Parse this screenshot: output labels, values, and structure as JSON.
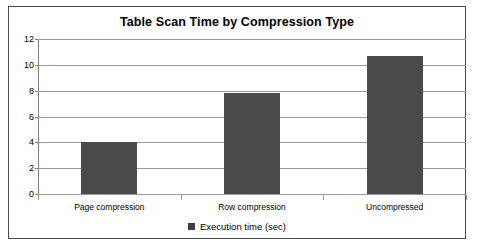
{
  "chart_data": {
    "type": "bar",
    "title": "Table Scan Time by Compression Type",
    "categories": [
      "Page compression",
      "Row compression",
      "Uncompressed"
    ],
    "values": [
      4.0,
      7.85,
      10.7
    ],
    "series": [
      {
        "name": "Execution time (sec)",
        "values": [
          4.0,
          7.85,
          10.7
        ]
      }
    ],
    "xlabel": "",
    "ylabel": "",
    "ylim": [
      0,
      12
    ],
    "ytick_labels": [
      "0",
      "2",
      "4",
      "6",
      "8",
      "10",
      "12"
    ],
    "ytick_values": [
      0,
      2,
      4,
      6,
      8,
      10,
      12
    ],
    "grid": true,
    "legend_position": "bottom",
    "legend_entries": [
      "Execution time (sec)"
    ],
    "bar_color": "#4a4a4a",
    "gridline_color": "#9a9a9a",
    "border_color": "#4a4a4a",
    "background_color": "#ffffff"
  }
}
